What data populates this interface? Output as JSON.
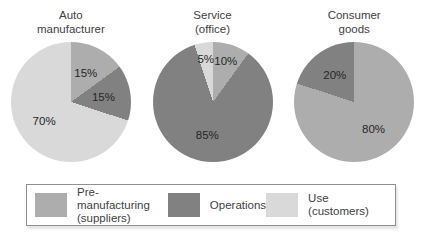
{
  "colors": {
    "pre_manufacturing": "#adadad",
    "operations": "#818181",
    "use": "#d9d9d9"
  },
  "chart_data": [
    {
      "type": "pie",
      "title": "Auto\nmanufacturer",
      "start_angle_deg": 0,
      "direction": "clockwise",
      "slices": [
        {
          "label": "Pre-manufacturing (suppliers)",
          "value": 15,
          "display": "15%",
          "color_key": "pre_manufacturing"
        },
        {
          "label": "Operations",
          "value": 15,
          "display": "15%",
          "color_key": "operations"
        },
        {
          "label": "Use (customers)",
          "value": 70,
          "display": "70%",
          "color_key": "use"
        }
      ]
    },
    {
      "type": "pie",
      "title": "Service\n(office)",
      "start_angle_deg": 0,
      "direction": "clockwise",
      "slices": [
        {
          "label": "Pre-manufacturing (suppliers)",
          "value": 10,
          "display": "10%",
          "color_key": "pre_manufacturing"
        },
        {
          "label": "Operations",
          "value": 85,
          "display": "85%",
          "color_key": "operations"
        },
        {
          "label": "Use (customers)",
          "value": 5,
          "display": "5%",
          "color_key": "use"
        }
      ]
    },
    {
      "type": "pie",
      "title": "Consumer\ngoods",
      "start_angle_deg": 0,
      "direction": "clockwise",
      "slices": [
        {
          "label": "Pre-manufacturing (suppliers)",
          "value": 80,
          "display": "80%",
          "color_key": "pre_manufacturing"
        },
        {
          "label": "Operations",
          "value": 20,
          "display": "20%",
          "color_key": "operations"
        }
      ]
    }
  ],
  "legend": {
    "items": [
      {
        "label": "Pre-manufacturing\n(suppliers)",
        "color_key": "pre_manufacturing"
      },
      {
        "label": "Operations",
        "color_key": "operations"
      },
      {
        "label": "Use (customers)",
        "color_key": "use"
      }
    ]
  }
}
